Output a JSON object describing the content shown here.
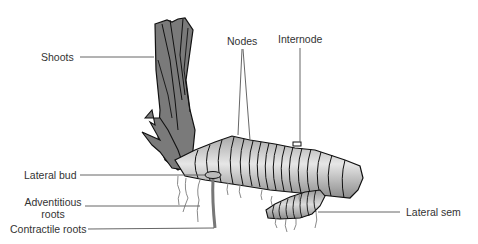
{
  "diagram": {
    "labels": {
      "shoots": "Shoots",
      "nodes": "Nodes",
      "internode": "Internode",
      "lateral_bud": "Lateral bud",
      "adventitious_roots_line1": "Adventitious",
      "adventitious_roots_line2": "roots",
      "contractile_roots": "Contractile roots",
      "lateral_sem": "Lateral sem"
    },
    "colors": {
      "outline": "#111111",
      "shoot_fill": "#7a7a7a",
      "rhizome_light": "#e0e0e0",
      "rhizome_dark": "#8c8c8c",
      "leader_line": "#555555",
      "label_text": "#333333",
      "root": "#8a8a8a",
      "background": "#ffffff"
    }
  }
}
